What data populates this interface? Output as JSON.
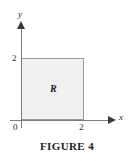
{
  "figure": {
    "caption": "FIGURE 4",
    "region_label": "R"
  },
  "axes": {
    "x_name": "x",
    "y_name": "y",
    "origin_label": "0",
    "x_tick_label": "2",
    "y_tick_label": "2"
  },
  "colors": {
    "region_fill": "#f1f1f1",
    "region_stroke": "#9a9a9a",
    "axis": "#7d7d7d",
    "arrow": "#3a3a3a",
    "text": "#1d1d1d",
    "background": "#ffffff"
  },
  "chart_data": {
    "type": "area",
    "title": "FIGURE 4",
    "xlabel": "x",
    "ylabel": "y",
    "xlim": [
      0,
      2
    ],
    "ylim": [
      0,
      2
    ],
    "xticks": [
      0,
      2
    ],
    "yticks": [
      2
    ],
    "xtick_labels": [
      "0",
      "2"
    ],
    "ytick_labels": [
      "2"
    ],
    "grid": false,
    "legend": null,
    "annotations": [
      {
        "text": "R",
        "x": 1,
        "y": 1,
        "description": "label of the shaded square region"
      }
    ],
    "shapes": [
      {
        "kind": "rectangle",
        "label": "R",
        "x0": 0,
        "y0": 0,
        "x1": 2,
        "y1": 2,
        "fill": "#f1f1f1",
        "stroke": "#9a9a9a"
      }
    ]
  }
}
